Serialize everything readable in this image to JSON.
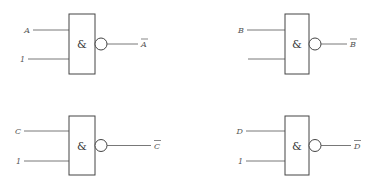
{
  "diagram": {
    "title": "",
    "gates": [
      {
        "id": "gate-a",
        "type": "NAND",
        "symbol": "&",
        "inputs": [
          {
            "label": "A"
          },
          {
            "label": "1"
          }
        ],
        "output": {
          "label": "A",
          "overline": true
        },
        "box": {
          "x": 69,
          "y": 14,
          "w": 26,
          "h": 60
        },
        "in_y": [
          30,
          59
        ],
        "in_x0": [
          33,
          28
        ],
        "out_x1": 138,
        "out_label_x": 141
      },
      {
        "id": "gate-b",
        "type": "NAND",
        "symbol": "&",
        "inputs": [
          {
            "label": "B"
          },
          {
            "label": ""
          }
        ],
        "output": {
          "label": "B",
          "overline": true
        },
        "box": {
          "x": 285,
          "y": 14,
          "w": 24,
          "h": 60
        },
        "in_y": [
          30,
          59
        ],
        "in_x0": [
          247,
          248
        ],
        "out_x1": 347,
        "out_label_x": 350
      },
      {
        "id": "gate-c",
        "type": "NAND",
        "symbol": "&",
        "inputs": [
          {
            "label": "C"
          },
          {
            "label": "1"
          }
        ],
        "output": {
          "label": "C",
          "overline": true
        },
        "box": {
          "x": 69,
          "y": 116,
          "w": 26,
          "h": 59
        },
        "in_y": [
          131,
          161
        ],
        "in_x0": [
          24,
          24
        ],
        "out_x1": 151,
        "out_label_x": 154
      },
      {
        "id": "gate-d",
        "type": "NAND",
        "symbol": "&",
        "inputs": [
          {
            "label": "D"
          },
          {
            "label": "1"
          }
        ],
        "output": {
          "label": "D",
          "overline": true
        },
        "box": {
          "x": 285,
          "y": 116,
          "w": 24,
          "h": 59
        },
        "in_y": [
          131,
          161
        ],
        "in_x0": [
          246,
          246
        ],
        "out_x1": 351,
        "out_label_x": 354
      }
    ]
  }
}
